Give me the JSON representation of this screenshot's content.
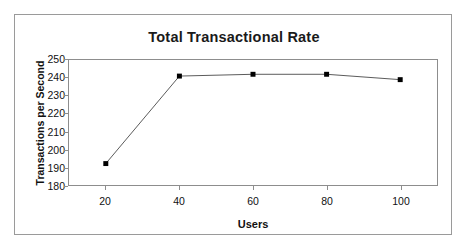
{
  "chart_data": {
    "type": "line",
    "title": "Total Transactional Rate",
    "xlabel": "Users",
    "ylabel": "Transactions per Second",
    "x": [
      20,
      40,
      60,
      80,
      100
    ],
    "values": [
      192,
      241,
      242,
      242,
      239
    ],
    "series": [
      {
        "name": "Transactions per Second",
        "values": [
          192,
          241,
          242,
          242,
          239
        ]
      }
    ],
    "xlim": [
      10,
      110
    ],
    "ylim": [
      180,
      250
    ],
    "x_ticks": [
      "20",
      "40",
      "60",
      "80",
      "100"
    ],
    "y_ticks": [
      "250",
      "240",
      "230",
      "220",
      "210",
      "200",
      "190",
      "180"
    ],
    "grid": false,
    "legend": false,
    "marker": "square",
    "marker_color": "#000000",
    "line_color": "#595959",
    "plot_border_color": "#8d8d8d",
    "frame_border_color": "#9a9a9a",
    "background_color": "#ffffff"
  }
}
